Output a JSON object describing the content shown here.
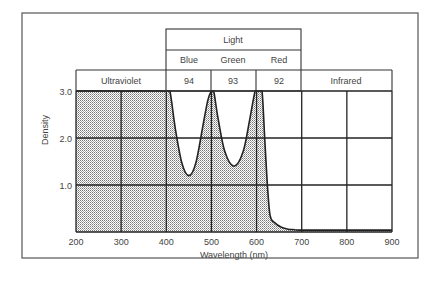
{
  "chart_data": {
    "type": "area",
    "title": "",
    "xlabel": "Wavelength (nm)",
    "ylabel": "Density",
    "xlim": [
      200,
      900
    ],
    "ylim": [
      0,
      3.0
    ],
    "x_ticks": [
      "200",
      "300",
      "400",
      "500",
      "600",
      "700",
      "800",
      "900"
    ],
    "y_ticks": [
      "1.0",
      "2.0",
      "3.0"
    ],
    "grid": true,
    "fill": "stippled grey under curve",
    "header_bands": {
      "top_group": {
        "label": "Light",
        "from": 400,
        "to": 700
      },
      "sub_labels": [
        {
          "label": "Blue",
          "from": 400,
          "to": 500
        },
        {
          "label": "Green",
          "from": 500,
          "to": 600
        },
        {
          "label": "Red",
          "from": 600,
          "to": 700
        }
      ],
      "row": [
        {
          "label": "Ultraviolet",
          "from": 200,
          "to": 400
        },
        {
          "label": "94",
          "from": 400,
          "to": 500
        },
        {
          "label": "93",
          "from": 500,
          "to": 600
        },
        {
          "label": "92",
          "from": 600,
          "to": 700
        },
        {
          "label": "Infrared",
          "from": 700,
          "to": 900
        }
      ]
    },
    "series": [
      {
        "name": "Density",
        "x": [
          200,
          300,
          400,
          408,
          420,
          435,
          450,
          465,
          480,
          492,
          500,
          505,
          515,
          530,
          550,
          570,
          585,
          597,
          605,
          612,
          618,
          624,
          630,
          640,
          655,
          670,
          685,
          700,
          800,
          900
        ],
        "values": [
          3.0,
          3.0,
          3.0,
          3.0,
          2.2,
          1.45,
          1.2,
          1.45,
          2.2,
          2.8,
          3.0,
          3.0,
          2.4,
          1.7,
          1.4,
          1.7,
          2.4,
          3.0,
          3.0,
          3.0,
          2.0,
          1.0,
          0.35,
          0.2,
          0.1,
          0.06,
          0.05,
          0.04,
          0.04,
          0.04
        ]
      }
    ]
  }
}
